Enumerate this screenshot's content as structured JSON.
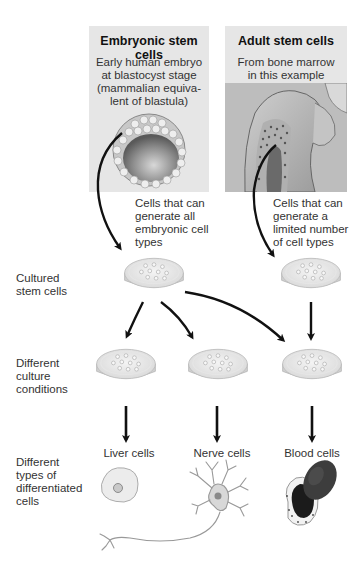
{
  "panels": {
    "embryonic": {
      "title": "Embryonic stem cells",
      "lines": [
        "Early human embryo",
        "at blastocyst stage",
        "(mammalian equiva-",
        "lent of blastula)"
      ],
      "illustration": "blastocyst-illustration"
    },
    "adult": {
      "title": "Adult stem cells",
      "lines": [
        "From bone marrow",
        "in this example"
      ],
      "illustration": "bone-marrow-illustration"
    }
  },
  "notes": {
    "embryonic": [
      "Cells that can",
      "generate all",
      "embryonic cell",
      "types"
    ],
    "adult": [
      "Cells that can",
      "generate a",
      "limited number",
      "of cell types"
    ]
  },
  "row_labels": {
    "cultured": [
      "Cultured",
      "stem cells"
    ],
    "conditions": [
      "Different",
      "culture",
      "conditions"
    ],
    "differentiated": [
      "Different",
      "types of",
      "differentiated",
      "cells"
    ]
  },
  "cell_types": [
    {
      "label": "Liver cells",
      "icon": "liver-cell-icon"
    },
    {
      "label": "Nerve cells",
      "icon": "nerve-cell-icon"
    },
    {
      "label": "Blood cells",
      "icon": "blood-cells-icon"
    }
  ],
  "colors": {
    "panel_bg": "#e6e6e6",
    "arrow": "#111111",
    "dish": "#e9e9e9"
  }
}
